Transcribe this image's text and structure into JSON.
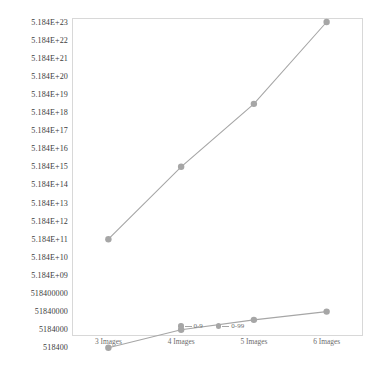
{
  "chart_data": {
    "type": "line",
    "title": "",
    "subtitle": "",
    "xlabel": "",
    "ylabel": "",
    "categories": [
      "3 Images",
      "4 Images",
      "5 Images",
      "6 Images"
    ],
    "yticklabels": [
      "5.184E+23",
      "5.184E+22",
      "5.184E+21",
      "5.184E+20",
      "5.184E+19",
      "5.184E+18",
      "5.184E+17",
      "5.184E+16",
      "5.184E+15",
      "5.184E+14",
      "5.184E+13",
      "5.184E+12",
      "5.184E+11",
      "5.184E+10",
      "5.184E+09",
      "518400000",
      "51840000",
      "5184000",
      "518400"
    ],
    "yscale": "log",
    "ylim": [
      518400,
      5.184e+23
    ],
    "grid": false,
    "legend_position": "inside-bottom-center",
    "series": [
      {
        "name": "0-9",
        "color": "#a6a6a6",
        "marker": "circle",
        "values": [
          518400,
          5184000,
          18144000,
          51840000
        ],
        "ylabels_at_points": [
          "518400",
          "5184000",
          "1.8144E+07",
          "51840000"
        ]
      },
      {
        "name": "0-99",
        "color": "#a6a6a6",
        "marker": "circle",
        "values": [
          518400000000.0,
          5184000000000000.0,
          1.5552e+19,
          5.184e+23
        ],
        "ylabels_at_points": [
          "5.184E+11",
          "5.184E+15",
          "1.5552E+19",
          "5.184E+23"
        ]
      }
    ]
  },
  "legend": {
    "entries": [
      {
        "label": "0-9"
      },
      {
        "label": "0-99"
      }
    ]
  },
  "caption": {
    "text": ""
  },
  "colors": {
    "series_gray": "#a6a6a6",
    "frame": "#d8d8d8",
    "tick_text": "#3c3c3c",
    "xtick_text": "#6d6d6d"
  }
}
